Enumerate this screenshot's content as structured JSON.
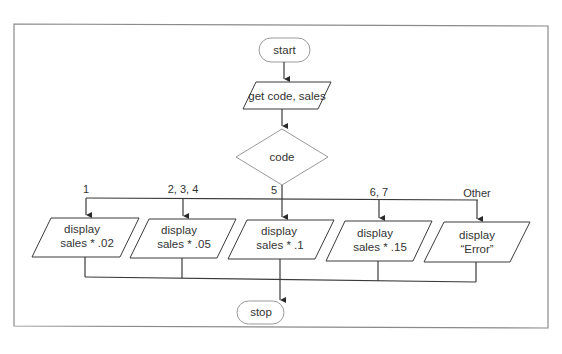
{
  "flowchart": {
    "start": "start",
    "input": "get code, sales",
    "decision": "code",
    "stop": "stop",
    "branches": [
      {
        "label": "1",
        "line1": "display",
        "line2": "sales * .02"
      },
      {
        "label": "2, 3, 4",
        "line1": "display",
        "line2": "sales * .05"
      },
      {
        "label": "5",
        "line1": "display",
        "line2": "sales * .1"
      },
      {
        "label": "6, 7",
        "line1": "display",
        "line2": "sales * .15"
      },
      {
        "label": "Other",
        "line1": "display",
        "line2": "“Error”"
      }
    ]
  },
  "colors": {
    "frame": "#8a8a8a",
    "line": "#3a3a3a",
    "terminal_border": "#9a9a9a"
  }
}
